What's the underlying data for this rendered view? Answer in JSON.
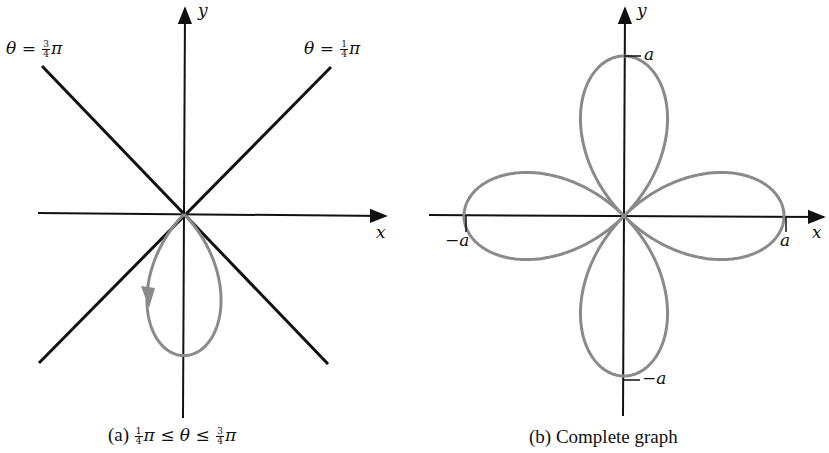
{
  "figure": {
    "curve_equation": "r = a cos 2θ",
    "colors": {
      "axes": "#111111",
      "curve": "#8a8a8a",
      "background": "#ffffff"
    }
  },
  "panel_a": {
    "origin": [
      184,
      214
    ],
    "axis_labels": {
      "x": "x",
      "y": "y"
    },
    "ray_labels": [
      {
        "theta": "θ",
        "equals": "=",
        "num": "3",
        "den": "4",
        "pi": "π"
      },
      {
        "theta": "θ",
        "equals": "=",
        "num": "1",
        "den": "4",
        "pi": "π"
      }
    ],
    "caption": {
      "prefix": "(a)",
      "lower_num": "1",
      "lower_den": "4",
      "pi1": "π",
      "le1": "≤",
      "theta": "θ",
      "le2": "≤",
      "upper_num": "3",
      "upper_den": "4",
      "pi2": "π"
    },
    "lobe_scale_px": 166
  },
  "panel_b": {
    "origin": [
      624,
      216
    ],
    "axis_labels": {
      "x": "x",
      "y": "y"
    },
    "tick_labels": {
      "pos_x": "a",
      "neg_x": "−a",
      "pos_y": "a",
      "neg_y": "−a"
    },
    "caption": "(b)  Complete graph",
    "a_px": 160
  },
  "chart_data": {
    "type": "line",
    "panels": [
      {
        "label": "(a) 1/4π ≤ θ ≤ 3/4π",
        "xlabel": "x",
        "ylabel": "y",
        "theta_range": [
          "π/4",
          "3π/4"
        ],
        "rays": [
          "θ = 3/4π",
          "θ = 1/4π"
        ],
        "description": "Single lobe traced below origin (r negative), arrow indicates direction of tracing",
        "lobe_tip": [
          0,
          -1
        ]
      },
      {
        "label": "(b) Complete graph",
        "xlabel": "x",
        "ylabel": "y",
        "theta_range": [
          "0",
          "2π"
        ],
        "lobe_tips": [
          [
            1,
            0
          ],
          [
            0,
            1
          ],
          [
            -1,
            0
          ],
          [
            0,
            -1
          ]
        ],
        "tick_labels": [
          "a",
          "−a",
          "a",
          "−a"
        ]
      }
    ]
  }
}
